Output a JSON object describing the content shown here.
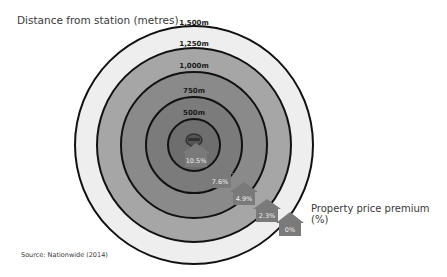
{
  "title": "Distance from station (metres)",
  "source": "Source: Nationwide (2014)",
  "legend_label": "Property price premium (%)",
  "center_icon": "train-icon",
  "rings": [
    {
      "label": "1,500m",
      "radius": 120,
      "fill": "#eeeeee"
    },
    {
      "label": "1,250m",
      "radius": 97,
      "fill": "#a6a6a6"
    },
    {
      "label": "1,000m",
      "radius": 73,
      "fill": "#8a8a8a"
    },
    {
      "label": "750m",
      "radius": 48,
      "fill": "#7b7b7b"
    },
    {
      "label": "500m",
      "radius": 26,
      "fill": "#6e6e6e"
    }
  ],
  "premiums": [
    {
      "distance": "0-500m",
      "value": "10.5%"
    },
    {
      "distance": "500-750m",
      "value": "7.6%"
    },
    {
      "distance": "750-1,000m",
      "value": "4.9%"
    },
    {
      "distance": "1,000-1,250m",
      "value": "2.3%"
    },
    {
      "distance": "1,250-1,500m",
      "value": "0%"
    }
  ],
  "colors": {
    "house": "#7a7a7a",
    "ring_stroke": "#111111"
  }
}
